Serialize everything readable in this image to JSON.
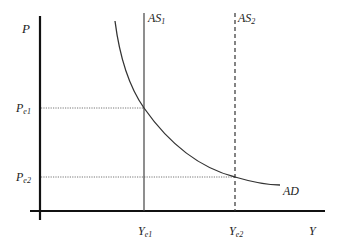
{
  "diagram": {
    "title": "",
    "axes": {
      "y_label": "P",
      "x_label": "Y"
    },
    "curves": [
      {
        "name": "AS1",
        "label_main": "AS",
        "label_sub": "1",
        "style": "solid-vertical"
      },
      {
        "name": "AS2",
        "label_main": "AS",
        "label_sub": "2",
        "style": "dashed-vertical"
      },
      {
        "name": "AD",
        "label_main": "AD",
        "label_sub": "",
        "style": "downward-curve"
      }
    ],
    "price_levels": [
      {
        "label_main": "P",
        "label_sub": "e1"
      },
      {
        "label_main": "P",
        "label_sub": "e2"
      }
    ],
    "output_levels": [
      {
        "label_main": "Y",
        "label_sub": "e1"
      },
      {
        "label_main": "Y",
        "label_sub": "e2"
      }
    ],
    "colors": {
      "axis": "#111111",
      "curve": "#333333",
      "guide": "#666666"
    }
  }
}
